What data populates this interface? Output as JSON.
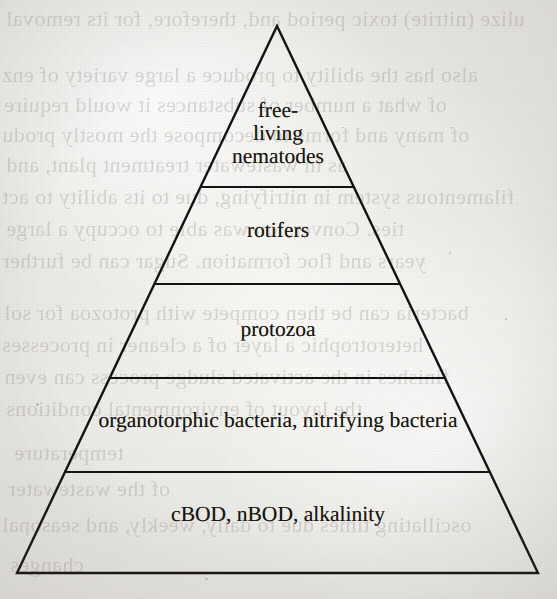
{
  "figure": {
    "kind": "trophic-pyramid",
    "shape": "triangle",
    "tier_count": 5,
    "colors": {
      "ink": "#17150f",
      "paper": "#e9e7e3",
      "line": "#141210",
      "ghost_text": "#8d8a84"
    },
    "geometry": {
      "apex": {
        "x": 277,
        "y": 26
      },
      "base_left": {
        "x": 17,
        "y": 573
      },
      "base_right": {
        "x": 538,
        "y": 573
      },
      "divider_y": [
        187,
        284,
        378,
        472
      ],
      "stroke_width": 2.4
    }
  },
  "pyramid": {
    "tiers": [
      {
        "index": 0,
        "name": "free-living-nematodes",
        "lines": [
          "free-",
          "living",
          "nematodes"
        ],
        "text": "free-living nematodes",
        "band_top_y": 26,
        "band_bottom_y": 187
      },
      {
        "index": 1,
        "name": "rotifers",
        "lines": [
          "rotifers"
        ],
        "text": "rotifers",
        "band_top_y": 187,
        "band_bottom_y": 284
      },
      {
        "index": 2,
        "name": "protozoa",
        "lines": [
          "protozoa"
        ],
        "text": "protozoa",
        "band_top_y": 284,
        "band_bottom_y": 378
      },
      {
        "index": 3,
        "name": "organotorphic-nitrifying-bacteria",
        "lines": [
          "organotorphic bacteria, nitrifying bacteria"
        ],
        "text": "organotorphic bacteria, nitrifying bacteria",
        "band_top_y": 378,
        "band_bottom_y": 472
      },
      {
        "index": 4,
        "name": "cbod-nbod-alkalinity",
        "lines": [
          "cBOD, nBOD, alkalinity"
        ],
        "text": "cBOD, nBOD, alkalinity",
        "band_top_y": 472,
        "band_bottom_y": 573
      }
    ]
  },
  "background": {
    "description": "faint mirrored show-through text from the reverse side of the scanned book page",
    "ghost_lines": [
      {
        "text": "ulize (nitrite) toxic period and, therefore, for its removal",
        "x": 6,
        "y": 6,
        "size": 22
      },
      {
        "text": "also has the ability to produce a large variety of enz",
        "x": 2,
        "y": 62,
        "size": 22
      },
      {
        "text": "of what a number of substances it would require",
        "x": 4,
        "y": 92,
        "size": 22
      },
      {
        "text": "of many and forms to decompose the mostly produ",
        "x": 2,
        "y": 122,
        "size": 22
      },
      {
        "text": "as in wastewater treatment plant, and",
        "x": 6,
        "y": 152,
        "size": 22
      },
      {
        "text": "filamentous system in nitrifying, due to its ability to act",
        "x": 2,
        "y": 184,
        "size": 22
      },
      {
        "text": "ties. Conversion was able to occupy a large",
        "x": 6,
        "y": 216,
        "size": 22
      },
      {
        "text": "years and floc formation. Sugar can be further",
        "x": 2,
        "y": 248,
        "size": 22
      },
      {
        "text": "bacteria can be then compete with protozoa for sol",
        "x": 4,
        "y": 300,
        "size": 22
      },
      {
        "text": "heterotrophic a layer of a cleaner in processes",
        "x": 2,
        "y": 332,
        "size": 22
      },
      {
        "text": "finishes in the activated sludge process can even",
        "x": 4,
        "y": 364,
        "size": 22
      },
      {
        "text": "the layout of environmental conditions",
        "x": 6,
        "y": 396,
        "size": 22
      },
      {
        "text": "temperature",
        "x": 14,
        "y": 440,
        "size": 22
      },
      {
        "text": "of the wastewater",
        "x": 8,
        "y": 476,
        "size": 22
      },
      {
        "text": "oscillating times due to daily, weekly, and seasonal",
        "x": 2,
        "y": 512,
        "size": 22
      },
      {
        "text": "changes",
        "x": 10,
        "y": 552,
        "size": 22
      }
    ]
  }
}
